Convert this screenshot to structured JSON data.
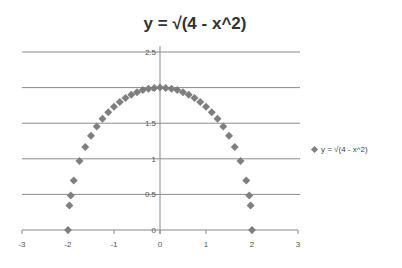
{
  "chart_data": {
    "type": "scatter",
    "title": "y = √(4 - x^2)",
    "xlabel": "",
    "ylabel": "",
    "xlim": [
      -3,
      3
    ],
    "ylim": [
      0,
      2.5
    ],
    "x_ticks": [
      "-3",
      "-2",
      "-1",
      "0",
      "1",
      "2",
      "3"
    ],
    "y_ticks": [
      "0",
      "0.5",
      "1",
      "1.5",
      "2",
      "2.5"
    ],
    "grid": "horizontal",
    "legend_position": "right",
    "marker": "diamond",
    "marker_color": "#7f7f7f",
    "series": [
      {
        "name": "y = √(4 - x^2)",
        "x": [
          -2,
          -1.97,
          -1.94,
          -1.875,
          -1.75,
          -1.625,
          -1.5,
          -1.375,
          -1.25,
          -1.125,
          -1.0,
          -0.875,
          -0.75,
          -0.625,
          -0.5,
          -0.375,
          -0.25,
          -0.125,
          0,
          0.125,
          0.25,
          0.375,
          0.5,
          0.625,
          0.75,
          0.875,
          1.0,
          1.125,
          1.25,
          1.375,
          1.5,
          1.625,
          1.75,
          1.875,
          1.94,
          1.97,
          2
        ],
        "y": [
          0,
          0.345,
          0.486,
          0.696,
          0.968,
          1.166,
          1.323,
          1.452,
          1.561,
          1.654,
          1.732,
          1.798,
          1.854,
          1.9,
          1.936,
          1.965,
          1.984,
          1.996,
          2,
          1.996,
          1.984,
          1.965,
          1.936,
          1.9,
          1.854,
          1.798,
          1.732,
          1.654,
          1.561,
          1.452,
          1.323,
          1.166,
          0.968,
          0.696,
          0.486,
          0.345,
          0
        ]
      }
    ]
  },
  "legend": {
    "label": "y = √(4 - x^2)"
  }
}
